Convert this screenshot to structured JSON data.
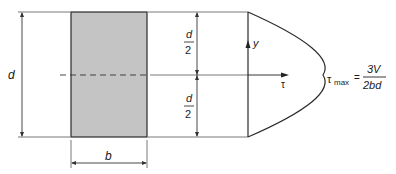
{
  "diagram": {
    "colors": {
      "line": "#2a2a2a",
      "fill": "#c4c4c4",
      "background": "#ffffff"
    },
    "section": {
      "depth_label": "d",
      "width_label": "b"
    },
    "half_depth": {
      "numerator": "d",
      "denominator": "2"
    },
    "axes": {
      "vertical": "y",
      "horizontal": "τ"
    },
    "formula": {
      "lhs_symbol": "τ",
      "lhs_subscript": "max",
      "equals": "=",
      "numerator": "3V",
      "denominator": "2bd"
    }
  }
}
